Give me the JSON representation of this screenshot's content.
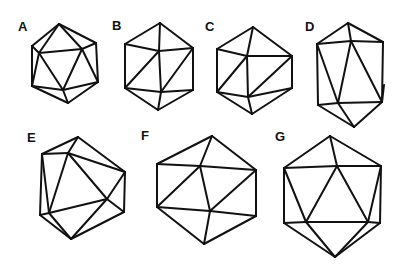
{
  "figure": {
    "panels": [
      {
        "label": "A",
        "label_pos": [
          23,
          31
        ],
        "vertices": {
          "top": [
            59,
            24
          ],
          "ul": [
            32,
            46
          ],
          "ur": [
            96,
            43
          ],
          "il": [
            39,
            53
          ],
          "ir": [
            82,
            49
          ],
          "ll": [
            32,
            86
          ],
          "lr": [
            98,
            82
          ],
          "ib": [
            63,
            90
          ],
          "bot": [
            68,
            103
          ]
        },
        "edges": [
          [
            "top",
            "ul"
          ],
          [
            "top",
            "ur"
          ],
          [
            "top",
            "il"
          ],
          [
            "top",
            "ir"
          ],
          [
            "ul",
            "il"
          ],
          [
            "ur",
            "ir"
          ],
          [
            "il",
            "ir"
          ],
          [
            "ul",
            "ll"
          ],
          [
            "ur",
            "lr"
          ],
          [
            "il",
            "ll"
          ],
          [
            "il",
            "ib"
          ],
          [
            "ir",
            "ib"
          ],
          [
            "ir",
            "lr"
          ],
          [
            "ll",
            "ib"
          ],
          [
            "ib",
            "lr"
          ],
          [
            "ll",
            "bot"
          ],
          [
            "ib",
            "bot"
          ],
          [
            "lr",
            "bot"
          ]
        ]
      },
      {
        "label": "B",
        "label_pos": [
          117,
          30
        ],
        "vertices": {
          "top": [
            160,
            23
          ],
          "ul": [
            125,
            44
          ],
          "ur": [
            193,
            48
          ],
          "ct": [
            159,
            51
          ],
          "ll": [
            125,
            88
          ],
          "cb": [
            161,
            92
          ],
          "lr": [
            193,
            90
          ],
          "bot": [
            158,
            110
          ]
        },
        "edges": [
          [
            "top",
            "ul"
          ],
          [
            "top",
            "ur"
          ],
          [
            "top",
            "ct"
          ],
          [
            "ul",
            "ct"
          ],
          [
            "ct",
            "ur"
          ],
          [
            "ul",
            "ll"
          ],
          [
            "ur",
            "lr"
          ],
          [
            "ct",
            "ll"
          ],
          [
            "ct",
            "cb"
          ],
          [
            "ur",
            "cb"
          ],
          [
            "ll",
            "cb"
          ],
          [
            "cb",
            "lr"
          ],
          [
            "ll",
            "bot"
          ],
          [
            "cb",
            "bot"
          ],
          [
            "lr",
            "bot"
          ]
        ]
      },
      {
        "label": "C",
        "label_pos": [
          210,
          31
        ],
        "vertices": {
          "top": [
            253,
            27
          ],
          "ul": [
            217,
            49
          ],
          "ur": [
            292,
            56
          ],
          "ct": [
            247,
            56
          ],
          "ll": [
            217,
            92
          ],
          "cb": [
            248,
            97
          ],
          "lr": [
            292,
            88
          ],
          "bot": [
            252,
            114
          ]
        },
        "edges": [
          [
            "top",
            "ul"
          ],
          [
            "top",
            "ur"
          ],
          [
            "top",
            "ct"
          ],
          [
            "ul",
            "ct"
          ],
          [
            "ct",
            "ur"
          ],
          [
            "ul",
            "ll"
          ],
          [
            "ur",
            "lr"
          ],
          [
            "ct",
            "ll"
          ],
          [
            "ct",
            "cb"
          ],
          [
            "ur",
            "cb"
          ],
          [
            "ll",
            "cb"
          ],
          [
            "cb",
            "lr"
          ],
          [
            "ll",
            "bot"
          ],
          [
            "cb",
            "bot"
          ],
          [
            "lr",
            "bot"
          ]
        ]
      },
      {
        "label": "D",
        "label_pos": [
          310,
          31
        ],
        "vertices": {
          "top": [
            348,
            23
          ],
          "ul": [
            317,
            44
          ],
          "it": [
            351,
            41
          ],
          "ur": [
            383,
            42
          ],
          "ll": [
            318,
            105
          ],
          "ib": [
            338,
            103
          ],
          "lr": [
            382,
            102
          ],
          "rm": [
            384,
            85
          ],
          "bot": [
            354,
            127
          ]
        },
        "edges": [
          [
            "top",
            "ul"
          ],
          [
            "top",
            "it"
          ],
          [
            "top",
            "ur"
          ],
          [
            "ul",
            "it"
          ],
          [
            "it",
            "ur"
          ],
          [
            "ul",
            "ll"
          ],
          [
            "ur",
            "lr"
          ],
          [
            "rm",
            "lr"
          ],
          [
            "ul",
            "ib"
          ],
          [
            "it",
            "ib"
          ],
          [
            "it",
            "lr"
          ],
          [
            "ll",
            "ib"
          ],
          [
            "ib",
            "lr"
          ],
          [
            "ll",
            "bot"
          ],
          [
            "ib",
            "bot"
          ],
          [
            "lr",
            "bot"
          ]
        ]
      },
      {
        "label": "E",
        "label_pos": [
          32,
          142
        ],
        "vertices": {
          "top": [
            78,
            137
          ],
          "ul": [
            42,
            154
          ],
          "ui": [
            68,
            153
          ],
          "rt": [
            125,
            172
          ],
          "ri": [
            107,
            199
          ],
          "rb": [
            124,
            212
          ],
          "lb": [
            40,
            215
          ],
          "il": [
            49,
            213
          ],
          "bot": [
            71,
            239
          ]
        },
        "edges": [
          [
            "top",
            "ul"
          ],
          [
            "top",
            "ui"
          ],
          [
            "top",
            "rt"
          ],
          [
            "ul",
            "ui"
          ],
          [
            "ui",
            "rt"
          ],
          [
            "ul",
            "lb"
          ],
          [
            "ul",
            "il"
          ],
          [
            "ui",
            "il"
          ],
          [
            "ui",
            "ri"
          ],
          [
            "rt",
            "ri"
          ],
          [
            "rt",
            "rb"
          ],
          [
            "il",
            "ri"
          ],
          [
            "ri",
            "rb"
          ],
          [
            "lb",
            "il"
          ],
          [
            "lb",
            "bot"
          ],
          [
            "il",
            "bot"
          ],
          [
            "ri",
            "bot"
          ],
          [
            "rb",
            "bot"
          ]
        ]
      },
      {
        "label": "F",
        "label_pos": [
          146,
          140
        ],
        "vertices": {
          "top": [
            212,
            136
          ],
          "ul": [
            157,
            164
          ],
          "it": [
            200,
            166
          ],
          "ur": [
            256,
            170
          ],
          "ll": [
            157,
            207
          ],
          "ib": [
            210,
            211
          ],
          "lr": [
            256,
            216
          ],
          "bot": [
            204,
            244
          ]
        },
        "edges": [
          [
            "top",
            "ul"
          ],
          [
            "top",
            "it"
          ],
          [
            "top",
            "ur"
          ],
          [
            "ul",
            "it"
          ],
          [
            "it",
            "ur"
          ],
          [
            "ul",
            "ll"
          ],
          [
            "ur",
            "lr"
          ],
          [
            "it",
            "ll"
          ],
          [
            "it",
            "ib"
          ],
          [
            "ur",
            "ib"
          ],
          [
            "ll",
            "ib"
          ],
          [
            "ib",
            "lr"
          ],
          [
            "ll",
            "bot"
          ],
          [
            "ib",
            "bot"
          ],
          [
            "lr",
            "bot"
          ]
        ]
      },
      {
        "label": "G",
        "label_pos": [
          280,
          141
        ],
        "vertices": {
          "top": [
            330,
            136
          ],
          "ul": [
            284,
            168
          ],
          "it": [
            337,
            166
          ],
          "ur": [
            381,
            166
          ],
          "ll": [
            284,
            223
          ],
          "il": [
            306,
            222
          ],
          "ir": [
            368,
            222
          ],
          "lr": [
            380,
            223
          ],
          "bot": [
            335,
            257
          ]
        },
        "edges": [
          [
            "top",
            "ul"
          ],
          [
            "top",
            "it"
          ],
          [
            "top",
            "ur"
          ],
          [
            "ul",
            "it"
          ],
          [
            "it",
            "ur"
          ],
          [
            "ul",
            "ll"
          ],
          [
            "ur",
            "lr"
          ],
          [
            "ul",
            "il"
          ],
          [
            "it",
            "il"
          ],
          [
            "it",
            "ir"
          ],
          [
            "ur",
            "ir"
          ],
          [
            "ll",
            "il"
          ],
          [
            "il",
            "ir"
          ],
          [
            "ir",
            "lr"
          ],
          [
            "ll",
            "bot"
          ],
          [
            "il",
            "bot"
          ],
          [
            "ir",
            "bot"
          ],
          [
            "lr",
            "bot"
          ]
        ]
      }
    ]
  }
}
